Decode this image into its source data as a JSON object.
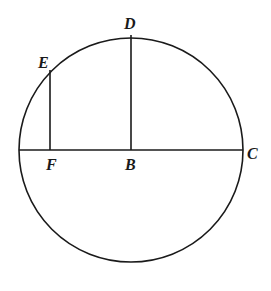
{
  "diagram": {
    "type": "geometry-circle",
    "stroke_color": "#1a1a1a",
    "background": "#ffffff",
    "circle": {
      "center": "B",
      "cx": 131,
      "cy": 150,
      "r": 112
    },
    "points": {
      "B": {
        "label": "B",
        "x": 131,
        "y": 150
      },
      "C": {
        "label": "C",
        "x": 243,
        "y": 150
      },
      "D": {
        "label": "D",
        "x": 131,
        "y": 35
      },
      "E": {
        "label": "E",
        "x": 50,
        "y": 70
      },
      "F": {
        "label": "F",
        "x": 50,
        "y": 150
      }
    },
    "segments": [
      {
        "name": "diameter",
        "from": "left-end",
        "to": "C"
      },
      {
        "name": "radius-BD",
        "from": "B",
        "to": "D"
      },
      {
        "name": "perpendicular-EF",
        "from": "E",
        "to": "F"
      }
    ],
    "labels": {
      "D": "D",
      "E": "E",
      "F": "F",
      "B": "B",
      "C": "C"
    }
  }
}
